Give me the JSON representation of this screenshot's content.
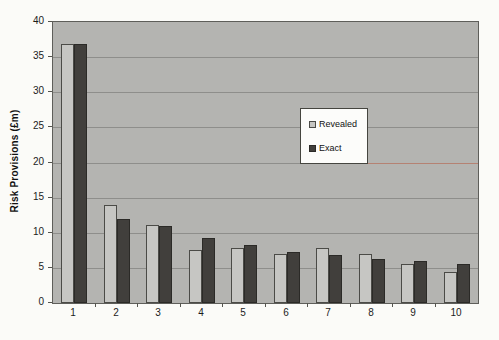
{
  "page": {
    "background": "#fbfbf8"
  },
  "chart_data": {
    "type": "bar",
    "title": "",
    "xlabel": "",
    "ylabel": "Risk Provisions (£m)",
    "categories": [
      "1",
      "2",
      "3",
      "4",
      "5",
      "6",
      "7",
      "8",
      "9",
      "10"
    ],
    "series": [
      {
        "name": "Revealed",
        "color": "#c6c6c3",
        "border": "#4b4b47",
        "values": [
          36.8,
          14.0,
          11.1,
          7.5,
          7.9,
          7.0,
          7.8,
          7.0,
          5.6,
          4.4
        ]
      },
      {
        "name": "Exact",
        "color": "#413f3c",
        "border": "#2b2a27",
        "values": [
          36.8,
          12.0,
          11.0,
          9.3,
          8.2,
          7.3,
          6.8,
          6.3,
          6.0,
          5.6
        ]
      }
    ],
    "ylim": [
      0,
      40
    ],
    "yticks": [
      0,
      5,
      10,
      15,
      20,
      25,
      30,
      35,
      40
    ],
    "grid": true,
    "plot_bg": "#b4b4b1",
    "gridline_color": "#8e8e8b",
    "legend_position": "inside-center-right",
    "artifact_line": {
      "value": 20,
      "color": "#bf7f6d",
      "note": "reddish discolored segment of the 20 gridline right of the legend"
    }
  }
}
